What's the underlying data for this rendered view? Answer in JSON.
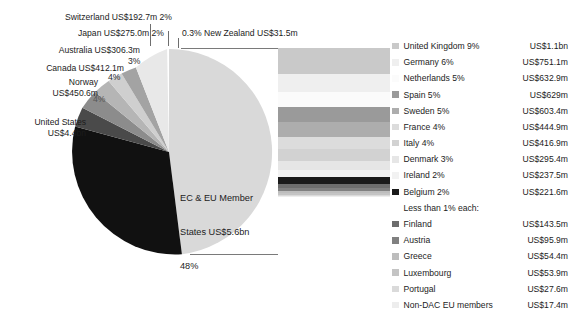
{
  "chart_data": {
    "type": "pie",
    "title": "",
    "subtitle": "",
    "xlabel": "",
    "ylabel": "",
    "legend_position": "right",
    "grid": false,
    "categories": [
      "EC & EU Member States",
      "United States",
      "Norway",
      "Canada",
      "Australia",
      "Japan",
      "Switzerland",
      "New Zealand"
    ],
    "values": [
      48,
      38,
      4,
      4,
      3,
      2,
      2,
      0.3
    ],
    "value_labels": [
      "US$5.6bn",
      "US$4.4bn",
      "US$450.6m",
      "US$412.1m",
      "US$306.3m",
      "US$275.0m",
      "US$192.7m",
      "US$31.5m"
    ],
    "colors": [
      "#d9d9d9",
      "#111111",
      "#4a4a4a",
      "#8c8c8c",
      "#b5b5b5",
      "#cfcfcf",
      "#a3a3a3",
      "#e8e8e8"
    ],
    "breakout": {
      "parent": "EC & EU Member States",
      "type": "bar",
      "orientation": "stacked-vertical",
      "categories": [
        "United Kingdom",
        "Germany",
        "Netherlands",
        "Spain",
        "Sweden",
        "France",
        "Italy",
        "Denmark",
        "Ireland",
        "Belgium",
        "Finland",
        "Austria",
        "Greece",
        "Luxembourg",
        "Portugal",
        "Non-DAC EU members"
      ],
      "values": [
        9,
        6,
        5,
        5,
        5,
        4,
        4,
        3,
        2,
        2,
        0.9,
        0.6,
        0.35,
        0.35,
        0.2,
        0.1
      ],
      "value_labels": [
        "US$1.1bn",
        "US$751.1m",
        "US$632.9m",
        "US$629m",
        "US$603.4m",
        "US$444.9m",
        "US$416.9m",
        "US$295.4m",
        "US$237.5m",
        "US$221.6m",
        "US$143.5m",
        "US$95.9m",
        "US$54.4m",
        "US$53.9m",
        "US$27.6m",
        "US$17.4m"
      ]
    }
  },
  "pie": {
    "slices": [
      {
        "key": "ec_eu",
        "name": "EC & EU Member States",
        "label_line1": "EC & EU Member",
        "label_line2": "States US$5.6bn",
        "label_line3": "48%",
        "percent": "48%",
        "value": "US$5.6bn",
        "color": "#d9d9d9"
      },
      {
        "key": "united_states",
        "name": "United States",
        "label_line1": "United States",
        "label_line2": "US$4.4bn",
        "percent": "38%",
        "value": "US$4.4bn",
        "color": "#111111"
      },
      {
        "key": "norway",
        "name": "Norway",
        "label_line1": "Norway",
        "label_line2": "US$450.6m",
        "percent": "4%",
        "value": "US$450.6m",
        "color": "#4a4a4a"
      },
      {
        "key": "canada",
        "name": "Canada",
        "label_line1": "Canada US$412.1m",
        "percent": "4%",
        "value": "US$412.1m",
        "color": "#8c8c8c"
      },
      {
        "key": "australia",
        "name": "Australia",
        "label_line1": "Australia US$306.3m",
        "percent": "3%",
        "value": "US$306.3m",
        "color": "#b5b5b5"
      },
      {
        "key": "japan",
        "name": "Japan",
        "label_line1": "Japan US$275.0m 2%",
        "percent": "2%",
        "value": "US$275.0m",
        "color": "#cfcfcf"
      },
      {
        "key": "switzerland",
        "name": "Switzerland",
        "label_line1": "Switzerland US$192.7m 2%",
        "percent": "2%",
        "value": "US$192.7m",
        "color": "#a3a3a3"
      },
      {
        "key": "new_zealand",
        "name": "New Zealand",
        "label_line1": "0.3% New Zealand US$31.5m",
        "percent": "0.3%",
        "value": "US$31.5m",
        "color": "#e8e8e8"
      }
    ]
  },
  "legend": {
    "subhead": "Less than 1% each:",
    "rows": [
      {
        "name": "United Kingdom 9%",
        "value": "US$1.1bn",
        "color": "#c9c9c9"
      },
      {
        "name": "Germany 6%",
        "value": "US$751.1m",
        "color": "#efefef"
      },
      {
        "name": "Netherlands 5%",
        "value": "US$632.9m",
        "color": "#fbfbfb"
      },
      {
        "name": "Spain 5%",
        "value": "US$629m",
        "color": "#9a9a9a"
      },
      {
        "name": "Sweden 5%",
        "value": "US$603.4m",
        "color": "#adadad"
      },
      {
        "name": "France 4%",
        "value": "US$444.9m",
        "color": "#dcdcdc"
      },
      {
        "name": "Italy 4%",
        "value": "US$416.9m",
        "color": "#d2d2d2"
      },
      {
        "name": "Denmark 3%",
        "value": "US$295.4m",
        "color": "#e6e6e6"
      },
      {
        "name": "Ireland 2%",
        "value": "US$237.5m",
        "color": "#f2f2f2"
      },
      {
        "name": "Belgium 2%",
        "value": "US$221.6m",
        "color": "#1a1a1a"
      },
      {
        "name": "Finland",
        "value": "US$143.5m",
        "color": "#6d6d6d"
      },
      {
        "name": "Austria",
        "value": "US$95.9m",
        "color": "#808080"
      },
      {
        "name": "Greece",
        "value": "US$54.4m",
        "color": "#bdbdbd"
      },
      {
        "name": "Luxembourg",
        "value": "US$53.9m",
        "color": "#c4c4c4"
      },
      {
        "name": "Portugal",
        "value": "US$27.6m",
        "color": "#dadada"
      },
      {
        "name": "Non-DAC EU members",
        "value": "US$17.4m",
        "color": "#ededed"
      }
    ]
  },
  "bar": {
    "segments": [
      {
        "name": "United Kingdom",
        "color": "#c9c9c9",
        "height_px": 26
      },
      {
        "name": "Germany",
        "color": "#efefef",
        "height_px": 18
      },
      {
        "name": "Netherlands",
        "color": "#fbfbfb",
        "height_px": 15
      },
      {
        "name": "Spain",
        "color": "#9a9a9a",
        "height_px": 15
      },
      {
        "name": "Sweden",
        "color": "#adadad",
        "height_px": 15
      },
      {
        "name": "France",
        "color": "#dcdcdc",
        "height_px": 12
      },
      {
        "name": "Italy",
        "color": "#d2d2d2",
        "height_px": 12
      },
      {
        "name": "Denmark",
        "color": "#e6e6e6",
        "height_px": 9
      },
      {
        "name": "Ireland",
        "color": "#f2f2f2",
        "height_px": 7
      },
      {
        "name": "Belgium",
        "color": "#1a1a1a",
        "height_px": 7
      },
      {
        "name": "Finland",
        "color": "#6d6d6d",
        "height_px": 4
      },
      {
        "name": "Austria",
        "color": "#808080",
        "height_px": 3
      },
      {
        "name": "Greece",
        "color": "#bdbdbd",
        "height_px": 2
      },
      {
        "name": "Luxembourg",
        "color": "#c4c4c4",
        "height_px": 2
      },
      {
        "name": "Portugal",
        "color": "#dadada",
        "height_px": 1
      },
      {
        "name": "Non-DAC EU members",
        "color": "#ededed",
        "height_px": 1
      }
    ]
  }
}
